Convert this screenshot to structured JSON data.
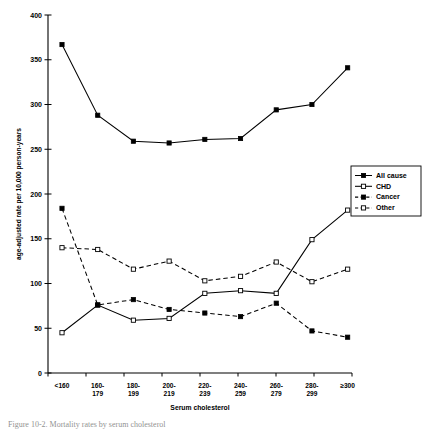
{
  "chart_data": {
    "type": "line",
    "title": "",
    "xlabel": "Serum cholesterol",
    "ylabel": "age-adjusted rate per 10,000 person-years",
    "categories": [
      "<160",
      "160-\n179",
      "180-\n199",
      "200-\n219",
      "220-\n239",
      "240-\n259",
      "260-\n279",
      "280-\n299",
      "≥300"
    ],
    "category_labels": [
      [
        "<160",
        ""
      ],
      [
        "160-",
        "179"
      ],
      [
        "180-",
        "199"
      ],
      [
        "200-",
        "219"
      ],
      [
        "220-",
        "239"
      ],
      [
        "240-",
        "259"
      ],
      [
        "260-",
        "279"
      ],
      [
        "280-",
        "299"
      ],
      [
        "≥300",
        ""
      ]
    ],
    "ylim": [
      0,
      400
    ],
    "yticks": [
      0,
      50,
      100,
      150,
      200,
      250,
      300,
      350,
      400
    ],
    "ytick_labels": [
      "0",
      "50",
      "100",
      "150",
      "200",
      "250",
      "300",
      "350",
      "400"
    ],
    "grid": false,
    "legend_position": "right",
    "series": [
      {
        "name": "All cause",
        "values": [
          367,
          288,
          259,
          257,
          261,
          262,
          294,
          300,
          341
        ],
        "line_style": "solid",
        "marker": "filled-square"
      },
      {
        "name": "CHD",
        "values": [
          45,
          76,
          59,
          61,
          89,
          92,
          89,
          149,
          182
        ],
        "line_style": "solid",
        "marker": "open-square"
      },
      {
        "name": "Cancer",
        "values": [
          184,
          76,
          82,
          71,
          67,
          63,
          78,
          47,
          40
        ],
        "line_style": "dashed",
        "marker": "filled-square"
      },
      {
        "name": "Other",
        "values": [
          140,
          138,
          116,
          125,
          103,
          108,
          124,
          102,
          116
        ],
        "line_style": "dashed",
        "marker": "open-square"
      }
    ]
  },
  "legend": {
    "items": [
      {
        "label": "All cause"
      },
      {
        "label": "CHD"
      },
      {
        "label": "Cancer"
      },
      {
        "label": "Other"
      }
    ]
  },
  "caption": {
    "text": "Figure 10-2.  Mortality rates by serum cholesterol"
  },
  "colors": {
    "ink": "#000000",
    "background": "#ffffff"
  }
}
